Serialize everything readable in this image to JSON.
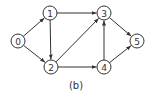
{
  "diagram": {
    "type": "directed-graph",
    "caption": "(b)",
    "colors": {
      "stroke": "#333333",
      "fill": "#ffffff",
      "text": "#333333"
    },
    "node_radius": 7,
    "nodes": [
      {
        "id": "0",
        "label": "0",
        "x": 18,
        "y": 41
      },
      {
        "id": "1",
        "label": "1",
        "x": 50,
        "y": 13
      },
      {
        "id": "2",
        "label": "2",
        "x": 51,
        "y": 67
      },
      {
        "id": "3",
        "label": "3",
        "x": 104,
        "y": 13
      },
      {
        "id": "4",
        "label": "4",
        "x": 104,
        "y": 67
      },
      {
        "id": "5",
        "label": "5",
        "x": 137,
        "y": 41
      }
    ],
    "edges": [
      {
        "from": "0",
        "to": "1"
      },
      {
        "from": "0",
        "to": "2"
      },
      {
        "from": "1",
        "to": "2"
      },
      {
        "from": "1",
        "to": "3"
      },
      {
        "from": "2",
        "to": "3"
      },
      {
        "from": "2",
        "to": "4"
      },
      {
        "from": "4",
        "to": "3"
      },
      {
        "from": "3",
        "to": "5"
      },
      {
        "from": "4",
        "to": "5"
      }
    ]
  }
}
